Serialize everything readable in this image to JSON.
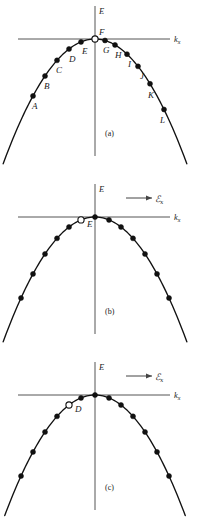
{
  "figure": {
    "axis": {
      "energy_label": "E",
      "k_label": "k",
      "k_subscript": "x"
    },
    "field": {
      "symbol": "ℰ",
      "subscript": "x",
      "arrow_icon": "right-arrow-icon"
    },
    "panels": [
      {
        "id": "a",
        "caption": "(a)",
        "show_field": false,
        "hole": {
          "label": "F",
          "k": 0.0,
          "label_dx": 4,
          "label_dy": -4
        },
        "electrons": [
          {
            "label": "A",
            "k": -0.62,
            "label_dx": -1,
            "label_dy": 13
          },
          {
            "label": "B",
            "k": -0.5,
            "label_dx": -1,
            "label_dy": 13
          },
          {
            "label": "C",
            "k": -0.38,
            "label_dx": -1,
            "label_dy": 13
          },
          {
            "label": "D",
            "k": -0.26,
            "label_dx": 0,
            "label_dy": 13
          },
          {
            "label": "E",
            "k": -0.14,
            "label_dx": 1,
            "label_dy": 12
          },
          {
            "label": "G",
            "k": 0.1,
            "label_dx": -2,
            "label_dy": 13
          },
          {
            "label": "H",
            "k": 0.2,
            "label_dx": 0,
            "label_dy": 13
          },
          {
            "label": "I",
            "k": 0.32,
            "label_dx": 1,
            "label_dy": 13
          },
          {
            "label": "J",
            "k": 0.43,
            "label_dx": 2,
            "label_dy": 13
          },
          {
            "label": "K",
            "k": 0.55,
            "label_dx": -2,
            "label_dy": 14
          },
          {
            "label": "L",
            "k": 0.69,
            "label_dx": -4,
            "label_dy": 14
          }
        ]
      },
      {
        "id": "b",
        "caption": "(b)",
        "show_field": true,
        "hole": {
          "label": "E",
          "k": -0.14,
          "label_dx": 6,
          "label_dy": 7
        },
        "electrons": [
          {
            "label": "",
            "k": -0.74,
            "label_dx": 0,
            "label_dy": 0
          },
          {
            "label": "",
            "k": -0.62,
            "label_dx": 0,
            "label_dy": 0
          },
          {
            "label": "",
            "k": -0.5,
            "label_dx": 0,
            "label_dy": 0
          },
          {
            "label": "",
            "k": -0.38,
            "label_dx": 0,
            "label_dy": 0
          },
          {
            "label": "",
            "k": -0.26,
            "label_dx": 0,
            "label_dy": 0
          },
          {
            "label": "",
            "k": 0.0,
            "label_dx": 0,
            "label_dy": 0
          },
          {
            "label": "",
            "k": 0.14,
            "label_dx": 0,
            "label_dy": 0
          },
          {
            "label": "",
            "k": 0.26,
            "label_dx": 0,
            "label_dy": 0
          },
          {
            "label": "",
            "k": 0.38,
            "label_dx": 0,
            "label_dy": 0
          },
          {
            "label": "",
            "k": 0.5,
            "label_dx": 0,
            "label_dy": 0
          },
          {
            "label": "",
            "k": 0.62,
            "label_dx": 0,
            "label_dy": 0
          },
          {
            "label": "",
            "k": 0.74,
            "label_dx": 0,
            "label_dy": 0
          }
        ]
      },
      {
        "id": "c",
        "caption": "(c)",
        "show_field": true,
        "hole": {
          "label": "D",
          "k": -0.26,
          "label_dx": 6,
          "label_dy": 7
        },
        "electrons": [
          {
            "label": "",
            "k": -0.74,
            "label_dx": 0,
            "label_dy": 0
          },
          {
            "label": "",
            "k": -0.62,
            "label_dx": 0,
            "label_dy": 0
          },
          {
            "label": "",
            "k": -0.5,
            "label_dx": 0,
            "label_dy": 0
          },
          {
            "label": "",
            "k": -0.38,
            "label_dx": 0,
            "label_dy": 0
          },
          {
            "label": "",
            "k": -0.14,
            "label_dx": 0,
            "label_dy": 0
          },
          {
            "label": "",
            "k": 0.0,
            "label_dx": 0,
            "label_dy": 0
          },
          {
            "label": "",
            "k": 0.14,
            "label_dx": 0,
            "label_dy": 0
          },
          {
            "label": "",
            "k": 0.26,
            "label_dx": 0,
            "label_dy": 0
          },
          {
            "label": "",
            "k": 0.38,
            "label_dx": 0,
            "label_dy": 0
          },
          {
            "label": "",
            "k": 0.5,
            "label_dx": 0,
            "label_dy": 0
          },
          {
            "label": "",
            "k": 0.62,
            "label_dx": 0,
            "label_dy": 0
          },
          {
            "label": "",
            "k": 0.74,
            "label_dx": 0,
            "label_dy": 0
          }
        ]
      }
    ]
  },
  "chart_data": {
    "type": "scatter",
    "xlabel": "k_x",
    "ylabel": "E",
    "grid": false,
    "legend": null,
    "curve": {
      "form": "E = -a*k^2",
      "a": 1.0,
      "xlim": [
        -0.95,
        0.95
      ],
      "ylim": [
        -0.9,
        0.06
      ]
    },
    "series": [
      {
        "name": "(a) band states",
        "points": [
          {
            "label": "A",
            "k": -0.62,
            "E": -0.384,
            "occupied": true
          },
          {
            "label": "B",
            "k": -0.5,
            "E": -0.25,
            "occupied": true
          },
          {
            "label": "C",
            "k": -0.38,
            "E": -0.144,
            "occupied": true
          },
          {
            "label": "D",
            "k": -0.26,
            "E": -0.068,
            "occupied": true
          },
          {
            "label": "E",
            "k": -0.14,
            "E": -0.02,
            "occupied": true
          },
          {
            "label": "F",
            "k": 0.0,
            "E": 0.0,
            "occupied": false
          },
          {
            "label": "G",
            "k": 0.1,
            "E": -0.01,
            "occupied": true
          },
          {
            "label": "H",
            "k": 0.2,
            "E": -0.04,
            "occupied": true
          },
          {
            "label": "I",
            "k": 0.32,
            "E": -0.102,
            "occupied": true
          },
          {
            "label": "J",
            "k": 0.43,
            "E": -0.185,
            "occupied": true
          },
          {
            "label": "K",
            "k": 0.55,
            "E": -0.303,
            "occupied": true
          },
          {
            "label": "L",
            "k": 0.69,
            "E": -0.476,
            "occupied": true
          }
        ]
      },
      {
        "name": "(b) after field applied",
        "points": [
          {
            "label": "",
            "k": -0.74,
            "E": -0.548,
            "occupied": true
          },
          {
            "label": "",
            "k": -0.62,
            "E": -0.384,
            "occupied": true
          },
          {
            "label": "",
            "k": -0.5,
            "E": -0.25,
            "occupied": true
          },
          {
            "label": "",
            "k": -0.38,
            "E": -0.144,
            "occupied": true
          },
          {
            "label": "",
            "k": -0.26,
            "E": -0.068,
            "occupied": true
          },
          {
            "label": "E",
            "k": -0.14,
            "E": -0.02,
            "occupied": false
          },
          {
            "label": "",
            "k": 0.0,
            "E": 0.0,
            "occupied": true
          },
          {
            "label": "",
            "k": 0.14,
            "E": -0.02,
            "occupied": true
          },
          {
            "label": "",
            "k": 0.26,
            "E": -0.068,
            "occupied": true
          },
          {
            "label": "",
            "k": 0.38,
            "E": -0.144,
            "occupied": true
          },
          {
            "label": "",
            "k": 0.5,
            "E": -0.25,
            "occupied": true
          },
          {
            "label": "",
            "k": 0.62,
            "E": -0.384,
            "occupied": true
          },
          {
            "label": "",
            "k": 0.74,
            "E": -0.548,
            "occupied": true
          }
        ]
      },
      {
        "name": "(c) hole advanced further",
        "points": [
          {
            "label": "",
            "k": -0.74,
            "E": -0.548,
            "occupied": true
          },
          {
            "label": "",
            "k": -0.62,
            "E": -0.384,
            "occupied": true
          },
          {
            "label": "",
            "k": -0.5,
            "E": -0.25,
            "occupied": true
          },
          {
            "label": "",
            "k": -0.38,
            "E": -0.144,
            "occupied": true
          },
          {
            "label": "D",
            "k": -0.26,
            "E": -0.068,
            "occupied": false
          },
          {
            "label": "",
            "k": -0.14,
            "E": -0.02,
            "occupied": true
          },
          {
            "label": "",
            "k": 0.0,
            "E": 0.0,
            "occupied": true
          },
          {
            "label": "",
            "k": 0.14,
            "E": -0.02,
            "occupied": true
          },
          {
            "label": "",
            "k": 0.26,
            "E": -0.068,
            "occupied": true
          },
          {
            "label": "",
            "k": 0.38,
            "E": -0.144,
            "occupied": true
          },
          {
            "label": "",
            "k": 0.5,
            "E": -0.25,
            "occupied": true
          },
          {
            "label": "",
            "k": 0.62,
            "E": -0.384,
            "occupied": true
          },
          {
            "label": "",
            "k": 0.74,
            "E": -0.548,
            "occupied": true
          }
        ]
      }
    ],
    "annotations": [
      {
        "text": "(a)",
        "panel": "a"
      },
      {
        "text": "(b)",
        "panel": "b"
      },
      {
        "text": "(c)",
        "panel": "c"
      },
      {
        "text": "ℰx",
        "panel": "b",
        "role": "electric-field-direction"
      },
      {
        "text": "ℰx",
        "panel": "c",
        "role": "electric-field-direction"
      }
    ]
  }
}
